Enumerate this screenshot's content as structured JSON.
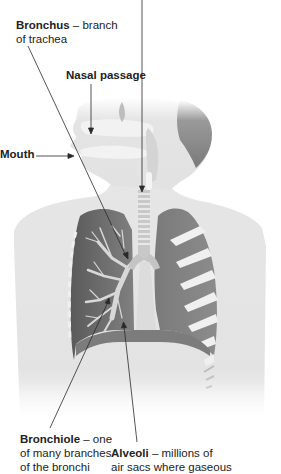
{
  "figure": {
    "type": "anatomical-diagram",
    "colors": {
      "background": "#ffffff",
      "body_silhouette": "#e3e3e3",
      "lung_dark": "#6e6e6e",
      "lung_mid": "#8a8a8a",
      "airway_light": "#d0d0d0",
      "rib_light": "#f0f0f0",
      "leader_line": "#333333"
    }
  },
  "labels": {
    "bronchus": {
      "term": "Bronchus",
      "desc_line1": " – branch",
      "desc_line2": "of trachea"
    },
    "nasal_passage": {
      "term": "Nasal passage"
    },
    "mouth": {
      "term": "Mouth"
    },
    "bronchiole": {
      "term": "Bronchiole",
      "desc_line1": " – one",
      "desc_line2": "of many branches",
      "desc_line3": "of the bronchi"
    },
    "alveoli": {
      "term": "Alveoli",
      "desc_line1": " – millions of",
      "desc_line2": "air sacs where gaseous"
    }
  }
}
